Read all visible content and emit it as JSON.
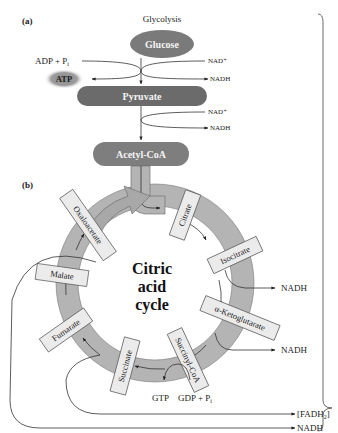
{
  "colors": {
    "dark_node": "#6b6b6b",
    "medium_node": "#7e7e7e",
    "ring": "#b4b4b4",
    "box_fill": "#ebebeb",
    "atp_glow": "#9a9a9a",
    "line": "#333333"
  },
  "panel_a": {
    "label": "(a)",
    "title": "Glycolysis",
    "nodes": {
      "glucose": "Glucose",
      "pyruvate": "Pyruvate",
      "acetyl_coa": "Acetyl-CoA"
    },
    "inputs": {
      "adp": "ADP + P",
      "adp_sub": "i",
      "atp": "ATP",
      "nad1": "NAD⁺",
      "nadh1": "NADH",
      "nad2": "NAD⁺",
      "nadh2": "NADH"
    }
  },
  "panel_b": {
    "label": "(b)",
    "center": [
      "Citric",
      "acid",
      "cycle"
    ],
    "intermediates": [
      "Citrate",
      "Isocitrate",
      "α-Ketoglutarate",
      "Succinyl-CoA",
      "Succinate",
      "Fumarate",
      "Malate",
      "Oxaloacetate"
    ],
    "outputs": {
      "nadh_isocitrate": "NADH",
      "nadh_ketoglutarate": "NADH",
      "gtp": "GTP",
      "gdp": "GDP + P",
      "gdp_sub": "i",
      "fadh2": "[FADH",
      "fadh2_sub": "2",
      "fadh2_close": "]",
      "nadh_malate": "NADH"
    }
  }
}
